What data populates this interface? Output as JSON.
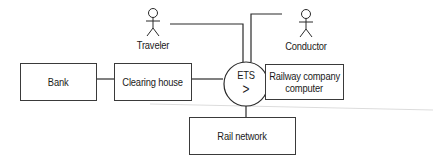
{
  "diagram": {
    "type": "context-diagram",
    "actors": [
      {
        "id": "traveler",
        "label": "Traveler"
      },
      {
        "id": "conductor",
        "label": "Conductor"
      }
    ],
    "system": {
      "id": "ets",
      "label": "ETS",
      "symbol": ">"
    },
    "boxes": [
      {
        "id": "bank",
        "label": "Bank"
      },
      {
        "id": "clearing-house",
        "label": "Clearing house"
      },
      {
        "id": "railway-company-computer",
        "label_line1": "Railway company",
        "label_line2": "computer"
      },
      {
        "id": "rail-network",
        "label": "Rail network"
      }
    ],
    "connections": [
      [
        "bank",
        "clearing-house"
      ],
      [
        "clearing-house",
        "ets"
      ],
      [
        "traveler",
        "ets"
      ],
      [
        "conductor",
        "ets"
      ],
      [
        "ets",
        "railway-company-computer"
      ],
      [
        "ets",
        "rail-network"
      ]
    ],
    "colors": {
      "line": "#2a2a2a",
      "faint_line": "#d8d8d8",
      "text": "#1a1a1a"
    }
  }
}
